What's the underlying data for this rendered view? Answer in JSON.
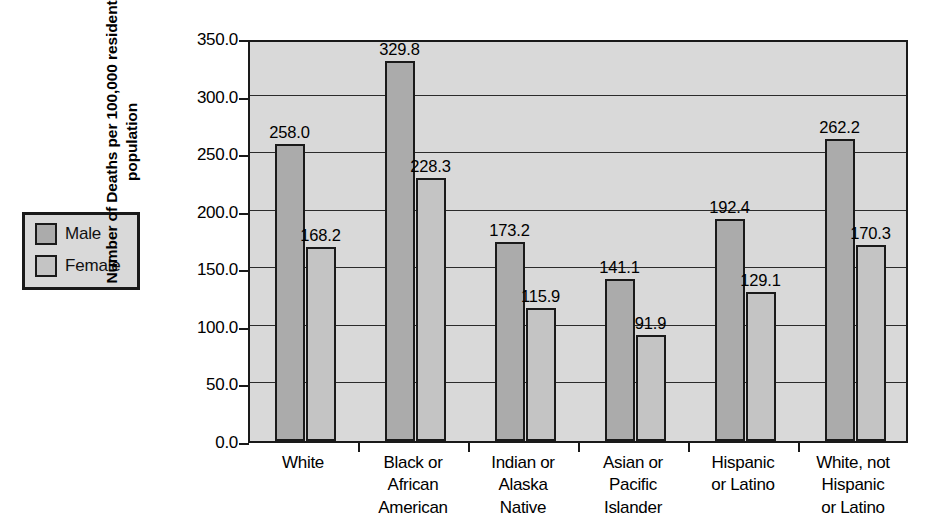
{
  "chart_data": {
    "type": "bar",
    "title": "",
    "xlabel": "",
    "ylabel_lines": [
      "Number of Deaths per 100,000 resident",
      "population"
    ],
    "ylabel": "Number of Deaths per 100,000 resident population",
    "categories": [
      [
        "White"
      ],
      [
        "Black or",
        "African",
        "American"
      ],
      [
        "Indian or",
        "Alaska",
        "Native"
      ],
      [
        "Asian or",
        "Pacific",
        "Islander"
      ],
      [
        "Hispanic",
        "or Latino"
      ],
      [
        "White, not",
        "Hispanic",
        "or Latino"
      ]
    ],
    "series": [
      {
        "name": "Male",
        "color": "#ababab",
        "values": [
          258.0,
          329.8,
          173.2,
          141.1,
          192.4,
          262.2
        ]
      },
      {
        "name": "Female",
        "color": "#c4c4c4",
        "values": [
          168.2,
          228.3,
          115.9,
          91.9,
          129.1,
          170.3
        ]
      }
    ],
    "value_labels": [
      [
        "258.0",
        "168.2"
      ],
      [
        "329.8",
        "228.3"
      ],
      [
        "173.2",
        "115.9"
      ],
      [
        "141.1",
        "91.9"
      ],
      [
        "192.4",
        "129.1"
      ],
      [
        "262.2",
        "170.3"
      ]
    ],
    "ylim": [
      0.0,
      350.0
    ],
    "yticks": [
      0.0,
      50.0,
      100.0,
      150.0,
      200.0,
      250.0,
      300.0,
      350.0
    ],
    "ytick_labels": [
      "0.0",
      "50.0",
      "100.0",
      "150.0",
      "200.0",
      "250.0",
      "300.0",
      "350.0"
    ],
    "grid": true,
    "legend_position": "left-outside",
    "plot_background": "#d9d9d9",
    "axis_color": "#1a1a1a"
  },
  "legend": {
    "items": [
      {
        "label": "Male",
        "color": "#ababab"
      },
      {
        "label": "Female",
        "color": "#c4c4c4"
      }
    ]
  }
}
